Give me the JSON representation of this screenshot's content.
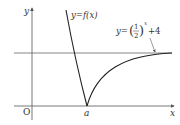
{
  "diagram": {
    "axes": {
      "x_label": "x",
      "y_label": "y",
      "origin_label": "O"
    },
    "point_label": "a",
    "curve_left_label": "y=f(x)",
    "curve_right_label": {
      "prefix": "y=",
      "fraction_num": "1",
      "fraction_den": "2",
      "exponent": "x",
      "suffix": "+4"
    },
    "asymptote": "y=4",
    "colors": {
      "axis": "#555555",
      "curve": "#222222",
      "asymptote": "#666666"
    }
  }
}
